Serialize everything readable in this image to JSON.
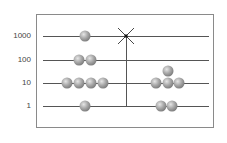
{
  "diagram": {
    "title": "",
    "rows": [
      {
        "label": "1000",
        "y": 36
      },
      {
        "label": "100",
        "y": 60
      },
      {
        "label": "10",
        "y": 83
      },
      {
        "label": "1",
        "y": 106
      }
    ],
    "left_group": {
      "beads_per_row": {
        "1000": 1,
        "100": 2,
        "10": 4,
        "1": 1
      }
    },
    "right_group": {
      "beads_per_row": {
        "1000": 0,
        "100": 0,
        "10": 3,
        "1": 2
      },
      "extra_bead_above_10": 1
    },
    "divider_marker": "x-mark",
    "colors": {
      "bead": "#8a8a8a",
      "line": "#555555",
      "frame": "#8a8a8a"
    }
  }
}
